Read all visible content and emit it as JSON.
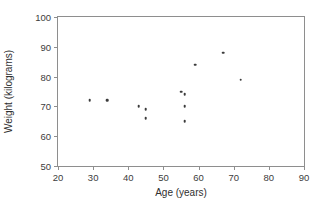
{
  "chart_data": {
    "type": "scatter",
    "title": "",
    "xlabel": "Age (years)",
    "ylabel": "Weight (kilograms)",
    "xlim": [
      20,
      90
    ],
    "ylim": [
      50,
      100
    ],
    "xticks": [
      20,
      30,
      40,
      50,
      60,
      70,
      80,
      90
    ],
    "yticks": [
      50,
      60,
      70,
      80,
      90,
      100
    ],
    "grid": false,
    "legend": null,
    "marker_color": "#3b3b3b",
    "frame_color": "#8e8e8e",
    "points": [
      {
        "x": 29,
        "y": 72
      },
      {
        "x": 34,
        "y": 72
      },
      {
        "x": 43,
        "y": 70
      },
      {
        "x": 45,
        "y": 69
      },
      {
        "x": 45,
        "y": 66
      },
      {
        "x": 55,
        "y": 75
      },
      {
        "x": 56,
        "y": 74
      },
      {
        "x": 56,
        "y": 70
      },
      {
        "x": 56,
        "y": 65
      },
      {
        "x": 59,
        "y": 84
      },
      {
        "x": 67,
        "y": 88
      },
      {
        "x": 72,
        "y": 79
      }
    ],
    "series": [
      {
        "name": "Age vs Weight",
        "x": [
          29,
          34,
          43,
          45,
          45,
          55,
          56,
          56,
          56,
          59,
          67,
          72
        ],
        "values": [
          72,
          72,
          70,
          69,
          66,
          75,
          74,
          70,
          65,
          84,
          88,
          79
        ]
      }
    ]
  }
}
